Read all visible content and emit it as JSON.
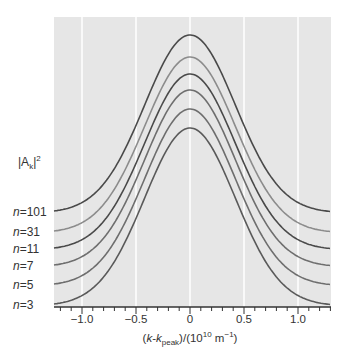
{
  "chart_data": {
    "type": "line",
    "title": "",
    "xlabel": "(k-k_peak)/(10^10 m^-1)",
    "xlabel_parts": {
      "pre": "(",
      "k1": "k",
      "dash": "-",
      "k2": "k",
      "sub": "peak",
      "mid": ")/(10",
      "sup": "10",
      "unit": " m",
      "unit_sup": "−1",
      "post": ")"
    },
    "ylabel": "|A_k|^2",
    "ylabel_parts": {
      "pre": "|A",
      "sub": "k",
      "mid": "|",
      "sup": "2"
    },
    "xlim": [
      -1.25,
      1.3
    ],
    "xticks": [
      -1.0,
      -0.5,
      0,
      0.5,
      1.0
    ],
    "xtick_labels": [
      "−1.0",
      "−0.5",
      "0",
      "0.5",
      "1.0"
    ],
    "minor_tick_step": 0.1,
    "grid": "vertical white lines at major ticks",
    "plot_background": "#e6e6e6",
    "note": "Curves are vertically offset Gaussian-like envelopes; values are relative heights above each curve's baseline (arbitrary units).",
    "series": [
      {
        "name": "n=101",
        "label": "101",
        "baseline_px": 213,
        "peak_px": 35,
        "color": "#4a4a4a"
      },
      {
        "name": "n=31",
        "label": "31",
        "baseline_px": 233,
        "peak_px": 57,
        "color": "#8c8c8c"
      },
      {
        "name": "n=11",
        "label": "11",
        "baseline_px": 250,
        "peak_px": 74,
        "color": "#4a4a4a"
      },
      {
        "name": "n=7",
        "label": "7",
        "baseline_px": 267,
        "peak_px": 90,
        "color": "#6e6e6e"
      },
      {
        "name": "n=5",
        "label": "5",
        "baseline_px": 286,
        "peak_px": 109,
        "color": "#6e6e6e"
      },
      {
        "name": "n=3",
        "label": "3",
        "baseline_px": 306,
        "peak_px": 128,
        "color": "#5a5a5a"
      }
    ],
    "series_shape": {
      "center": 0,
      "sigma": 0.42
    }
  }
}
